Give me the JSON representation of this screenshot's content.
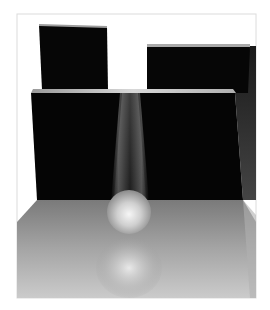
{
  "scene": {
    "description": "3D rendered scene: black blocks on a reflective grey floor with a glowing sphere under a light beam",
    "background": "#ffffff",
    "frame": {
      "x": 17,
      "y": 14,
      "w": 239,
      "h": 284,
      "stroke": "#d9d9d9"
    },
    "colors": {
      "block": "#060606",
      "block_top": "#c8c8c8",
      "floor_near": "#c9c9c9",
      "floor_far": "#7d7d7d",
      "side_wall": "#3a3a3a",
      "floor_side": "#a8a8a8",
      "sphere_highlight": "#f4f4f4",
      "sphere_shadow": "#8a8a8a"
    },
    "objects": [
      {
        "name": "back-left-block",
        "points": "39,25 107,27 108,90 42,90"
      },
      {
        "name": "back-right-block",
        "points": "147,46 250,46 248,93 147,93"
      },
      {
        "name": "front-wall",
        "points": "31,93 235,93 243,200 37,200"
      },
      {
        "name": "sphere",
        "cx": 129,
        "cy": 212,
        "r": 22
      },
      {
        "name": "sphere-reflection",
        "cx": 129,
        "cy": 265,
        "rx": 32,
        "ry": 26
      }
    ]
  }
}
